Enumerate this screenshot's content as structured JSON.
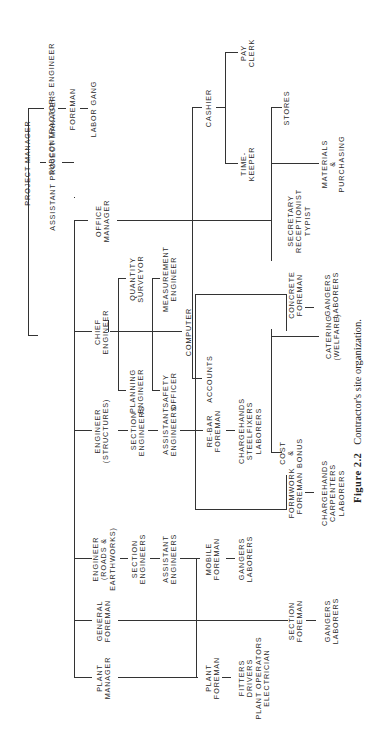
{
  "figure": {
    "number": "Figure 2.2",
    "caption": "Contractor's site organization."
  },
  "nodes": {
    "project_manager": "PROJECT MANAGER",
    "subcontractors_engineer": "SUBCONTRACTOR'S ENGINEER",
    "sub_foreman": "FOREMAN",
    "labor_gang": "LABOR GANG",
    "assistant_project_manager": "ASSISTANT PROJECT MANAGER",
    "office_manager": "OFFICE\nMANAGER",
    "chief_engineer": "CHIEF\nENGINEER",
    "engineer_structures": "ENGINEER\n(STRUCTURES)",
    "engineer_roads": "ENGINEER\n(ROADS &\nEARTHWORKS)",
    "general_foreman": "GENERAL\nFOREMAN",
    "plant_manager": "PLANT\nMANAGER",
    "cashier": "CASHIER",
    "pay_clerk": "PAY\nCLERK",
    "timekeeper": "TIME-\nKEEPER",
    "stores": "STORES",
    "materials_purchasing": "MATERIALS\n&\nPURCHASING",
    "secretary": "SECRETARY\nRECEPTIONIST\nTYPIST",
    "accounts": "ACCOUNTS",
    "catering": "CATERING\n(WELFARE)",
    "cost_bonus": "COST\n&\nBONUS",
    "quantity_surveyor": "QUANTITY\nSURVEYOR",
    "measurement_engineer": "MEASUREMENT\nENGINEER",
    "computer": "COMPUTER",
    "planning_engineer": "PLANNING\nENGINEER",
    "safety_officer": "SAFETY\nOFFICER",
    "section_engineers_s": "SECTION\nENGINEERS",
    "assistant_engineers_s": "ASSISTANT\nENGINEERS",
    "concrete_foreman": "CONCRETE\nFOREMAN",
    "concrete_gangers": "GANGERS\nLABORERS",
    "rebar_foreman": "RE-BAR\nFOREMAN",
    "rebar_crew": "CHARGEHANDS\nSTEELFIXERS\nLABORERS",
    "formwork_foreman": "FORMWORK\nFOREMAN",
    "formwork_crew": "CHARGEHANDS\nCARPENTERS\nLABORERS",
    "section_engineers_r": "SECTION\nENGINEERS",
    "assistant_engineers_r": "ASSISTANT\nENGINEERS",
    "mobile_foreman": "MOBILE\nFOREMAN",
    "mobile_gangers": "GANGERS\nLABORERS",
    "section_foreman": "SECTION\nFOREMAN",
    "section_gangers": "GANGERS\nLABORERS",
    "plant_foreman": "PLANT\nFOREMAN",
    "plant_crew": "FITTERS\nDRIVERS\nPLANT OPERATORS\nELECTRICIAN"
  }
}
